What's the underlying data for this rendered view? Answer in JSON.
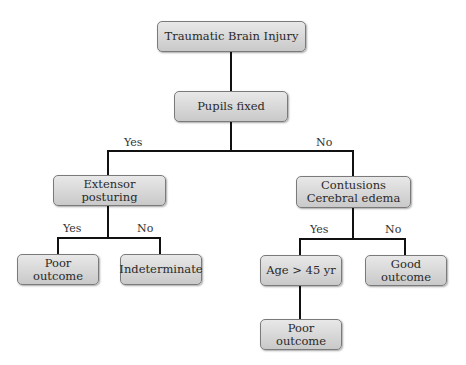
{
  "diagram": {
    "type": "decision-tree",
    "nodes": {
      "root": "Traumatic Brain Injury",
      "pupils": "Pupils fixed",
      "extensor": "Extensor posturing",
      "contusions": "Contusions\nCerebral edema",
      "poor1": "Poor\noutcome",
      "indeterminate": "Indeterminate",
      "age": "Age > 45 yr",
      "good": "Good\noutcome",
      "poor2": "Poor\noutcome"
    },
    "edge_labels": {
      "pupils_yes": "Yes",
      "pupils_no": "No",
      "extensor_yes": "Yes",
      "extensor_no": "No",
      "contusions_yes": "Yes",
      "contusions_no": "No"
    }
  }
}
